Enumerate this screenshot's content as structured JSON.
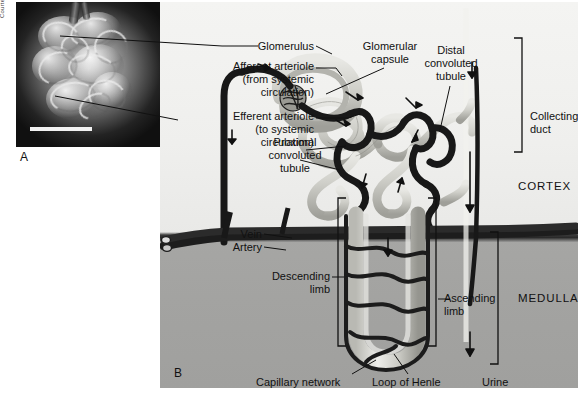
{
  "figure": {
    "caption": ""
  },
  "panel_a": {
    "letter": "A",
    "credit": "Courtesy of Kenjiro Kimura, MD, PhD",
    "description": "Scanning electron micrograph of a glomerulus",
    "scale_bar": ""
  },
  "panel_b": {
    "letter": "B",
    "description": "Diagram of a nephron with its blood supply",
    "regions": [
      {
        "name": "cortex",
        "label": "CORTEX"
      },
      {
        "name": "medulla",
        "label": "MEDULLA"
      }
    ],
    "labels": [
      {
        "name": "glomerulus",
        "text": "Glomerulus"
      },
      {
        "name": "afferent-arteriole",
        "text": "Afferent arteriole\n(from systemic\ncirculation)"
      },
      {
        "name": "efferent-arteriole",
        "text": "Efferent arteriole\n(to systemic\ncirculation)"
      },
      {
        "name": "glomerular-capsule",
        "text": "Glomerular\ncapsule"
      },
      {
        "name": "distal-convoluted-tubule",
        "text": "Distal\nconvoluted\ntubule"
      },
      {
        "name": "proximal-convoluted-tubule",
        "text": "Proximal\nconvoluted\ntubule"
      },
      {
        "name": "collecting-duct",
        "text": "Collecting\nduct"
      },
      {
        "name": "vein",
        "text": "Vein"
      },
      {
        "name": "artery",
        "text": "Artery"
      },
      {
        "name": "descending-limb",
        "text": "Descending\nlimb"
      },
      {
        "name": "ascending-limb",
        "text": "Ascending\nlimb"
      },
      {
        "name": "capillary-network",
        "text": "Capillary network"
      },
      {
        "name": "loop-of-henle",
        "text": "Loop of Henle"
      },
      {
        "name": "urine",
        "text": "Urine"
      }
    ],
    "label_text": {
      "glomerulus": "Glomerulus",
      "afferent_arteriole": "Afferent arteriole",
      "afferent_arteriole_l2": "(from systemic",
      "afferent_arteriole_l3": "circulation)",
      "efferent_arteriole": "Efferent arteriole",
      "efferent_arteriole_l2": "(to systemic",
      "efferent_arteriole_l3": "circulation)",
      "glomerular_capsule_l1": "Glomerular",
      "glomerular_capsule_l2": "capsule",
      "distal_l1": "Distal",
      "distal_l2": "convoluted",
      "distal_l3": "tubule",
      "proximal_l1": "Proximal",
      "proximal_l2": "convoluted",
      "proximal_l3": "tubule",
      "collecting_l1": "Collecting",
      "collecting_l2": "duct",
      "vein": "Vein",
      "artery": "Artery",
      "descending_l1": "Descending",
      "descending_l2": "limb",
      "ascending_l1": "Ascending",
      "ascending_l2": "limb",
      "capillary_network": "Capillary network",
      "loop_of_henle": "Loop of Henle",
      "urine": "Urine",
      "cortex": "CORTEX",
      "medulla": "MEDULLA"
    }
  },
  "colors": {
    "cortex_bg": "#efefed",
    "medulla_bg": "#a3a3a1",
    "vessel_dark": "#1b1b1b",
    "tubule_light": "#d6d6d2",
    "text": "#111111",
    "micrograph_bg": "#0c0c0c"
  }
}
